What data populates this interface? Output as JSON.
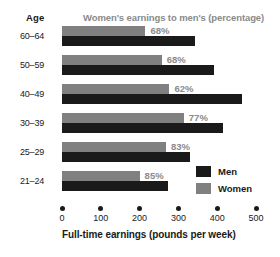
{
  "header": {
    "age_label": "Age",
    "subtitle": "Women's earnings to men's (percentage)"
  },
  "legend": {
    "items": [
      {
        "label": "Men",
        "color": "#1a1a1a"
      },
      {
        "label": "Women",
        "color": "#808080"
      }
    ]
  },
  "colors": {
    "men": "#1a1a1a",
    "women": "#808080",
    "pct_label": "#8a8a8a",
    "text": "#1a1a1a",
    "background": "#ffffff"
  },
  "chart_data": {
    "type": "bar",
    "orientation": "horizontal",
    "title": "",
    "subtitle": "Women's earnings to men's (percentage)",
    "xlabel": "Full-time earnings (pounds per week)",
    "ylabel": "Age",
    "xlim": [
      0,
      500
    ],
    "xticks": [
      0,
      100,
      200,
      300,
      400,
      500
    ],
    "xtick_labels": [
      "0",
      "100",
      "200",
      "300",
      "400",
      "500"
    ],
    "grid": false,
    "legend_position": "right",
    "categories": [
      "60-64",
      "50-59",
      "40-49",
      "30-39",
      "25-29",
      "21-24"
    ],
    "series": [
      {
        "name": "Women",
        "color": "#808080",
        "values": [
          215,
          257,
          277,
          314,
          268,
          200
        ]
      },
      {
        "name": "Men",
        "color": "#1a1a1a",
        "values": [
          343,
          391,
          463,
          414,
          329,
          272
        ]
      }
    ],
    "annotations": {
      "label": "ratio of women's to men's earnings",
      "values": [
        "68%",
        "68%",
        "62%",
        "77%",
        "83%",
        "85%"
      ]
    }
  }
}
